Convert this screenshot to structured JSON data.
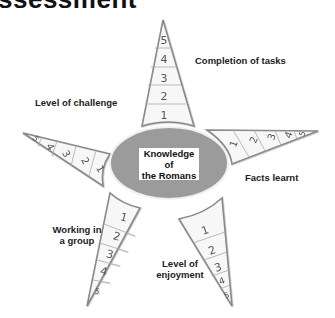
{
  "heading": "ssessment",
  "center": {
    "line1": "Knowledge of",
    "line2": "the Romans",
    "fill": "#9b9b9b"
  },
  "spikes": [
    {
      "id": "completion",
      "label": "Completion of tasks",
      "scale": [
        "1",
        "2",
        "3",
        "4",
        "5"
      ]
    },
    {
      "id": "facts",
      "label": "Facts learnt",
      "scale": [
        "1",
        "2",
        "3",
        "4",
        "5"
      ]
    },
    {
      "id": "enjoyment",
      "label_line1": "Level of",
      "label_line2": "enjoyment",
      "scale": [
        "1",
        "2",
        "3",
        "4",
        "5"
      ]
    },
    {
      "id": "group",
      "label_line1": "Working in",
      "label_line2": "a group",
      "scale": [
        "1",
        "2",
        "3",
        "4",
        "5"
      ]
    },
    {
      "id": "challenge",
      "label": "Level of challenge",
      "scale": [
        "1",
        "2",
        "3",
        "4",
        "5"
      ]
    }
  ],
  "colors": {
    "outline": "#8a8a8a",
    "spike_fill": "#f7f7f7",
    "text": "#222222"
  }
}
